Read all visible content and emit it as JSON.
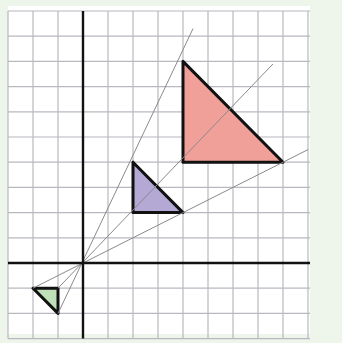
{
  "diagram": {
    "type": "enlargement-on-grid",
    "background_color": "#eef6ec",
    "grid": {
      "x_range": [
        -3,
        9
      ],
      "y_range": [
        -3,
        10
      ],
      "origin_px": [
        83,
        263
      ],
      "unit_px": 25.2,
      "grid_color": "#b8b8c0",
      "axis_color": "#111111"
    },
    "center_of_enlargement": [
      0,
      0
    ],
    "shapes": [
      {
        "name": "large-red-triangle",
        "vertices": [
          [
            4,
            8
          ],
          [
            4,
            4
          ],
          [
            8,
            4
          ]
        ],
        "fill": "#f0a098"
      },
      {
        "name": "medium-purple-triangle",
        "vertices": [
          [
            2,
            4
          ],
          [
            2,
            2
          ],
          [
            4,
            2
          ]
        ],
        "fill": "#b4a8d4"
      },
      {
        "name": "small-green-triangle",
        "vertices": [
          [
            -2,
            -1
          ],
          [
            -1,
            -1
          ],
          [
            -1,
            -2
          ]
        ],
        "fill": "#bfe0b8"
      }
    ],
    "rays": [
      {
        "from": [
          -1,
          -2
        ],
        "to": [
          4.4,
          9.3
        ]
      },
      {
        "from": [
          -1,
          -1
        ],
        "to": [
          7.6,
          7.9
        ]
      },
      {
        "from": [
          -2,
          -1
        ],
        "to": [
          9,
          4.5
        ]
      }
    ],
    "ray_color": "#8a8a8a"
  }
}
